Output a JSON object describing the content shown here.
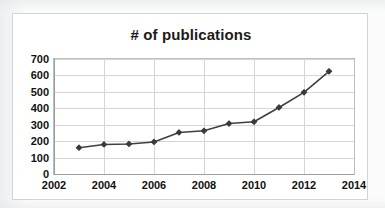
{
  "chart_data": {
    "type": "line",
    "title": "# of publications",
    "xlabel": "",
    "ylabel": "",
    "xlim": [
      2002,
      2014
    ],
    "ylim": [
      0,
      700
    ],
    "grid": true,
    "legend": false,
    "legend_position": "none",
    "x_tick_labels": [
      "2002",
      "2004",
      "2006",
      "2008",
      "2010",
      "2012",
      "2014"
    ],
    "x_ticks": [
      2002,
      2004,
      2006,
      2008,
      2010,
      2012,
      2014
    ],
    "y_tick_labels": [
      "0",
      "100",
      "200",
      "300",
      "400",
      "500",
      "600",
      "700"
    ],
    "y_ticks": [
      0,
      100,
      200,
      300,
      400,
      500,
      600,
      700
    ],
    "x": [
      2003,
      2004,
      2005,
      2006,
      2007,
      2008,
      2009,
      2010,
      2011,
      2012,
      2013
    ],
    "values": [
      160,
      180,
      183,
      195,
      253,
      263,
      307,
      318,
      405,
      497,
      625
    ],
    "series": [
      {
        "name": "# of publications",
        "x": [
          2003,
          2004,
          2005,
          2006,
          2007,
          2008,
          2009,
          2010,
          2011,
          2012,
          2013
        ],
        "values": [
          160,
          180,
          183,
          195,
          253,
          263,
          307,
          318,
          405,
          497,
          625
        ],
        "color": "#404040",
        "marker": "diamond"
      }
    ]
  },
  "style": {
    "line_color": "#404040",
    "marker_color": "#3a3a3a",
    "grid_color": "#d6d6d6",
    "axis_color": "#9e9e9e",
    "frame_color": "#d3d3d3",
    "text_color": "#111111",
    "background": "#ffffff"
  }
}
